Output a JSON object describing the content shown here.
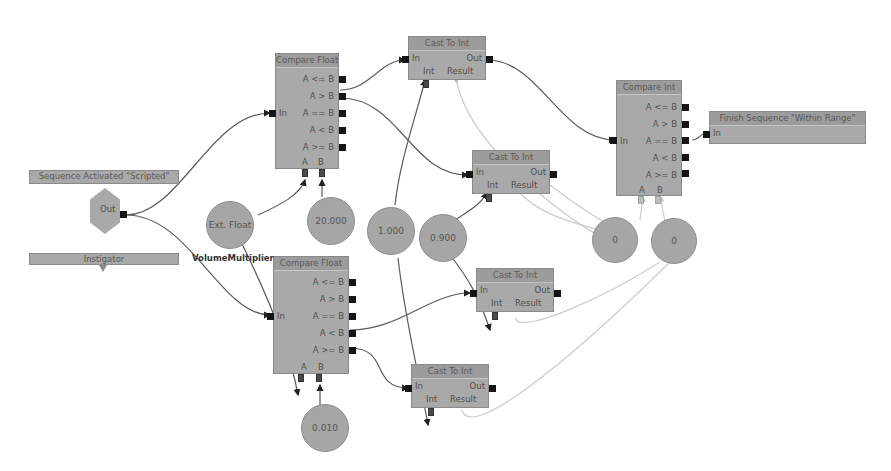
{
  "canvas": {
    "background": "#ffffff",
    "colors": {
      "node_body": "#a9a9a9",
      "node_header": "#9c9c9c",
      "exec_wire": "#555555",
      "int_wire": "#c8cfc8",
      "pin": "#151515"
    }
  },
  "event_node": {
    "title": "Sequence Activated \"Scripted\"",
    "out_label": "Out",
    "instigator_label": "Instigator"
  },
  "variables": {
    "ext_float": {
      "value": "Ext. Float",
      "name": "VolumeMultiplier"
    },
    "c_20000": "20.000",
    "c_1000": "1.000",
    "c_0900": "0.900",
    "c_0010": "0.010",
    "int_a": "0",
    "int_b": "0"
  },
  "compare_float_top": {
    "title": "Compare Float",
    "in_label": "In",
    "outputs": [
      "A <= B",
      "A > B",
      "A == B",
      "A < B",
      "A >= B"
    ],
    "a_label": "A",
    "b_label": "B"
  },
  "compare_float_bottom": {
    "title": "Compare Float",
    "in_label": "In",
    "outputs": [
      "A <= B",
      "A > B",
      "A == B",
      "A < B",
      "A >= B"
    ],
    "a_label": "A",
    "b_label": "B"
  },
  "cast_nodes": [
    {
      "title": "Cast To Int",
      "in_label": "In",
      "out_label": "Out",
      "int_label": "Int",
      "result_label": "Result"
    },
    {
      "title": "Cast To Int",
      "in_label": "In",
      "out_label": "Out",
      "int_label": "Int",
      "result_label": "Result"
    },
    {
      "title": "Cast To Int",
      "in_label": "In",
      "out_label": "Out",
      "int_label": "Int",
      "result_label": "Result"
    },
    {
      "title": "Cast To Int",
      "in_label": "In",
      "out_label": "Out",
      "int_label": "Int",
      "result_label": "Result"
    }
  ],
  "compare_int": {
    "title": "Compare Int",
    "in_label": "In",
    "outputs": [
      "A <= B",
      "A > B",
      "A == B",
      "A < B",
      "A >= B"
    ],
    "a_label": "A",
    "b_label": "B"
  },
  "finish_node": {
    "title": "Finish Sequence \"Within Range\"",
    "in_label": "In"
  }
}
